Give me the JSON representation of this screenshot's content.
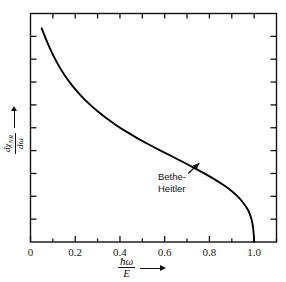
{
  "figure": {
    "background_color": "#ffffff",
    "ink_color": "#111111",
    "curve_color": "#000000"
  },
  "chart_data": {
    "type": "line",
    "title": "",
    "subtitle": "",
    "xlabel_numerator": "ħω",
    "xlabel_denominator": "E",
    "xlabel_arrow": "→",
    "ylabel_numerator": "dχ",
    "ylabel_numerator_subscript": "NR",
    "ylabel_denominator": "dω",
    "ylabel_arrow": "→",
    "xlim": [
      0,
      1.1
    ],
    "ylim": [
      0,
      1.0
    ],
    "grid": false,
    "legend": "none",
    "x_major_ticks": [
      0,
      0.2,
      0.4,
      0.6,
      0.8,
      1.0
    ],
    "x_major_tick_labels": [
      "0",
      "0.2",
      "0.4",
      "0.6",
      "0.8",
      "1.0"
    ],
    "x_minor_ticks": [
      0.1,
      0.3,
      0.5,
      0.7,
      0.9,
      1.1
    ],
    "y_tick_count": 10,
    "y_tick_labels": [],
    "series": [
      {
        "name": "Bethe-Heitler",
        "x": [
          0.05,
          0.07,
          0.09,
          0.11,
          0.14,
          0.17,
          0.2,
          0.24,
          0.28,
          0.32,
          0.36,
          0.4,
          0.45,
          0.5,
          0.55,
          0.6,
          0.65,
          0.7,
          0.75,
          0.8,
          0.85,
          0.88,
          0.91,
          0.94,
          0.96,
          0.975,
          0.985,
          0.993,
          0.998,
          1.0
        ],
        "y": [
          0.935,
          0.885,
          0.84,
          0.8,
          0.748,
          0.705,
          0.668,
          0.625,
          0.588,
          0.556,
          0.527,
          0.5,
          0.47,
          0.442,
          0.416,
          0.391,
          0.366,
          0.341,
          0.315,
          0.288,
          0.258,
          0.238,
          0.215,
          0.186,
          0.16,
          0.137,
          0.112,
          0.08,
          0.042,
          0.0
        ]
      }
    ],
    "annotations": [
      {
        "name": "bethe-heitler",
        "text_line1": "Bethe-",
        "text_line2": "Heitler",
        "arrow_from_x": 0.705,
        "arrow_from_y": 0.3,
        "arrow_to_x": 0.755,
        "arrow_to_y": 0.345
      }
    ]
  }
}
